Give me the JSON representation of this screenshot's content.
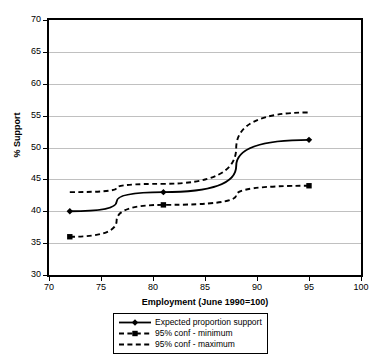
{
  "chart_data": {
    "type": "line",
    "title": "",
    "subtitle": "",
    "xlabel": "Employment (June 1990=100)",
    "ylabel": "% Support",
    "xlim": [
      70,
      100
    ],
    "ylim": [
      30,
      70
    ],
    "xticks": [
      70,
      75,
      80,
      85,
      90,
      95,
      100
    ],
    "yticks": [
      30,
      35,
      40,
      45,
      50,
      55,
      60,
      65,
      70
    ],
    "grid": "horizontal",
    "legend_position": "bottom-center",
    "series": [
      {
        "name": "Expected proportion support",
        "marker": "diamond",
        "linestyle": "solid",
        "color": "#000000",
        "x": [
          72,
          81,
          95
        ],
        "values": [
          40.0,
          43.0,
          51.2
        ]
      },
      {
        "name": "95% conf - minimum",
        "marker": "square",
        "linestyle": "dashed",
        "color": "#000000",
        "x": [
          72,
          81,
          95
        ],
        "values": [
          36.0,
          41.0,
          44.0
        ]
      },
      {
        "name": "95% conf - maximum",
        "marker": "none",
        "linestyle": "dashed",
        "color": "#000000",
        "x": [
          72,
          81,
          95
        ],
        "values": [
          43.0,
          44.3,
          55.5
        ]
      }
    ]
  },
  "legend": {
    "entries": [
      {
        "label": "Expected proportion support"
      },
      {
        "label": "95% conf - minimum"
      },
      {
        "label": "95% conf - maximum"
      }
    ]
  }
}
